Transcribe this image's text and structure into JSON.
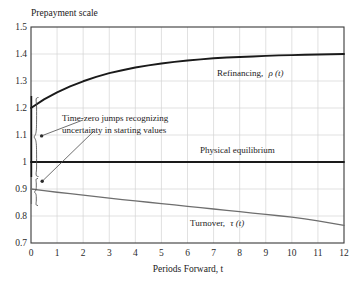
{
  "chart_data": {
    "type": "line",
    "title": "Prepayment scale",
    "xlabel": "Periods Forward, t",
    "ylabel": "",
    "xlim": [
      0,
      12
    ],
    "ylim": [
      0.7,
      1.5
    ],
    "grid": true,
    "legend_position": "inline-labels",
    "x_ticks": [
      "0",
      "1",
      "2",
      "3",
      "4",
      "5",
      "6",
      "7",
      "8",
      "9",
      "10",
      "11",
      "12"
    ],
    "y_ticks": [
      "0.7",
      "0.8",
      "0.9",
      "1",
      "1.1",
      "1.2",
      "1.3",
      "1.4",
      "1.5"
    ],
    "x": [
      0,
      0.5,
      1,
      1.5,
      2,
      2.5,
      3,
      3.5,
      4,
      4.5,
      5,
      5.5,
      6,
      6.5,
      7,
      7.5,
      8,
      8.5,
      9,
      9.5,
      10,
      10.5,
      11,
      11.5,
      12
    ],
    "series": [
      {
        "name": "Refinancing",
        "symbol": "ρ(t)",
        "label": "Refinancing,",
        "color": "#1a1a1a",
        "width": 1.9,
        "values": [
          1.2,
          1.232,
          1.258,
          1.28,
          1.299,
          1.315,
          1.329,
          1.34,
          1.35,
          1.358,
          1.365,
          1.371,
          1.376,
          1.38,
          1.384,
          1.387,
          1.389,
          1.391,
          1.393,
          1.395,
          1.396,
          1.397,
          1.398,
          1.399,
          1.4
        ]
      },
      {
        "name": "Physical equilibrium",
        "symbol": "",
        "label": "Physical equilibrium",
        "color": "#1a1a1a",
        "width": 1.9,
        "values": [
          1.0,
          1.0,
          1.0,
          1.0,
          1.0,
          1.0,
          1.0,
          1.0,
          1.0,
          1.0,
          1.0,
          1.0,
          1.0,
          1.0,
          1.0,
          1.0,
          1.0,
          1.0,
          1.0,
          1.0,
          1.0,
          1.0,
          1.0,
          1.0,
          1.0
        ]
      },
      {
        "name": "Turnover",
        "symbol": "τ(t)",
        "label": "Turnover,",
        "color": "#6e6e6e",
        "width": 1.3,
        "values": [
          0.9,
          0.894,
          0.888,
          0.883,
          0.877,
          0.872,
          0.866,
          0.861,
          0.856,
          0.851,
          0.846,
          0.841,
          0.836,
          0.831,
          0.826,
          0.821,
          0.816,
          0.811,
          0.806,
          0.801,
          0.796,
          0.789,
          0.782,
          0.774,
          0.765
        ]
      }
    ],
    "annotations": [
      {
        "name": "time-zero-jumps",
        "line1": "Time-zero jumps recognizing",
        "line2": "uncertainty in starting values"
      }
    ],
    "braces": [
      {
        "name": "refinancing-jump-brace",
        "from": 1.2,
        "to": 1.0
      },
      {
        "name": "turnover-jump-brace",
        "from": 1.0,
        "to": 0.9
      }
    ]
  },
  "labels": {
    "refinancing_label": "Refinancing,",
    "refinancing_symbol": "ρ",
    "physical_equilibrium_label": "Physical equilibrium",
    "turnover_label": "Turnover,",
    "turnover_symbol": "τ",
    "paren_t": "(t)"
  },
  "colors": {
    "curve_dark": "#1a1a1a",
    "curve_gray": "#6e6e6e",
    "grid": "#d4d4d4",
    "frame": "#3a3a3a",
    "background": "#ffffff"
  }
}
